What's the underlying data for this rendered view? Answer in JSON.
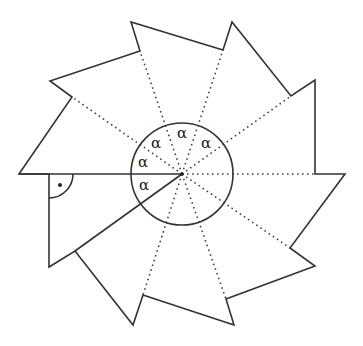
{
  "diagram": {
    "center": [
      182,
      174
    ],
    "circle_radius": 51,
    "outline_points": [
      [
        19,
        174
      ],
      [
        72,
        97
      ],
      [
        50,
        81
      ],
      [
        140,
        51
      ],
      [
        131,
        22
      ],
      [
        223,
        50
      ],
      [
        232,
        22
      ],
      [
        291,
        96
      ],
      [
        315,
        80
      ],
      [
        315,
        174
      ],
      [
        345,
        174
      ],
      [
        290,
        248
      ],
      [
        315,
        266
      ],
      [
        226,
        299
      ],
      [
        234,
        325
      ],
      [
        143,
        295
      ],
      [
        133,
        325
      ],
      [
        75,
        251
      ],
      [
        49,
        267
      ],
      [
        49,
        174
      ]
    ],
    "dotted_spokes_to": [
      [
        72,
        97
      ],
      [
        140,
        51
      ],
      [
        223,
        50
      ],
      [
        291,
        96
      ],
      [
        315,
        174
      ],
      [
        290,
        248
      ],
      [
        226,
        299
      ],
      [
        143,
        295
      ]
    ],
    "solid_spokes_to": [
      [
        19,
        174
      ],
      [
        75,
        251
      ]
    ],
    "right_angle_marker": {
      "vertex": [
        49,
        174
      ],
      "radius": 24,
      "dot": [
        60,
        185
      ]
    },
    "angle_labels": [
      {
        "text": "α",
        "x": 139,
        "y": 190
      },
      {
        "text": "α",
        "x": 138,
        "y": 167
      },
      {
        "text": "α",
        "x": 151,
        "y": 148
      },
      {
        "text": "α",
        "x": 177,
        "y": 138
      },
      {
        "text": "α",
        "x": 201,
        "y": 148
      }
    ]
  }
}
